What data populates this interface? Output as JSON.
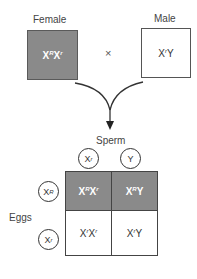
{
  "parents": {
    "female": {
      "label": "Female",
      "base1": "X",
      "allele1": "R",
      "base2": "X",
      "allele2": "r"
    },
    "male": {
      "label": "Male",
      "base1": "X",
      "allele1": "r",
      "base2": "Y",
      "allele2": ""
    },
    "cross_symbol": "×"
  },
  "punnett": {
    "sperm_label": "Sperm",
    "eggs_label": "Eggs",
    "sperm": [
      {
        "base": "X",
        "allele": "r"
      },
      {
        "base": "Y",
        "allele": ""
      }
    ],
    "eggs": [
      {
        "base": "X",
        "allele": "R"
      },
      {
        "base": "X",
        "allele": "r"
      }
    ],
    "cells": [
      [
        {
          "b1": "X",
          "a1": "R",
          "b2": "X",
          "a2": "r",
          "shaded": true
        },
        {
          "b1": "X",
          "a1": "R",
          "b2": "Y",
          "a2": "",
          "shaded": true
        }
      ],
      [
        {
          "b1": "X",
          "a1": "r",
          "b2": "X",
          "a2": "r",
          "shaded": false
        },
        {
          "b1": "X",
          "a1": "r",
          "b2": "Y",
          "a2": "",
          "shaded": false
        }
      ]
    ]
  },
  "colors": {
    "shaded": "#8a8a8a",
    "border": "#555555",
    "text": "#333333"
  }
}
